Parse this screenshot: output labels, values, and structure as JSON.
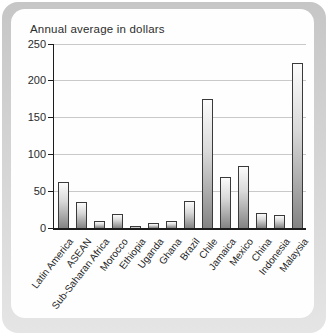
{
  "chart_data": {
    "type": "bar",
    "title": "Annual average in dollars",
    "categories": [
      "Latin America",
      "ASEAN",
      "Sub-Saharan Africa",
      "Morocco",
      "Ethiopia",
      "Uganda",
      "Ghana",
      "Brazil",
      "Chile",
      "Jamaica",
      "Mexico",
      "China",
      "Indonesia",
      "Malaysia"
    ],
    "values": [
      63,
      35,
      9,
      19,
      3,
      7,
      9,
      37,
      175,
      69,
      84,
      21,
      18,
      224
    ],
    "xlabel": "",
    "ylabel": "",
    "ylim": [
      0,
      250
    ],
    "yticks": [
      0,
      50,
      100,
      150,
      200,
      250
    ],
    "grid": true,
    "legend": "none",
    "colors": {
      "bar_top": "#fbfbfb",
      "bar_bottom": "#838383",
      "bar_border": "#3a3a3a",
      "axis": "#1c1c1c",
      "gridline": "#c9c9c9",
      "frame_top": "#c6c6c6",
      "frame_bottom": "#e5e5e5",
      "panel": "#fefefe"
    }
  }
}
